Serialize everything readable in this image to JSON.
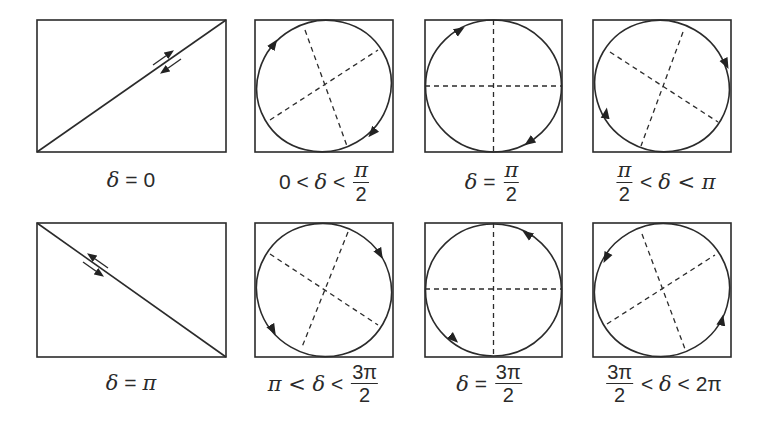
{
  "figure": {
    "stroke_color": "#2b2b2b",
    "panels": [
      {
        "id": "d0",
        "row": 0,
        "col": 0,
        "shape": "line",
        "orientation": "ascending",
        "label": {
          "parts": [
            "δ",
            " = ",
            "0"
          ],
          "text": "δ = 0"
        }
      },
      {
        "id": "d0-pi2",
        "row": 0,
        "col": 1,
        "shape": "ellipse",
        "axis_tilt": "major axis +45°",
        "rotation": "clockwise",
        "label": {
          "text": "0 < δ < π/2",
          "left": "0 < ",
          "delta": "δ",
          "rel": " < ",
          "num": "π",
          "den": "2"
        }
      },
      {
        "id": "dpi2",
        "row": 0,
        "col": 2,
        "shape": "circle",
        "rotation": "clockwise",
        "label": {
          "text": "δ = π/2",
          "delta": "δ",
          "rel": " = ",
          "num": "π",
          "den": "2"
        }
      },
      {
        "id": "dpi2-pi",
        "row": 0,
        "col": 3,
        "shape": "ellipse",
        "axis_tilt": "major axis -45°",
        "rotation": "clockwise",
        "label": {
          "text": "π/2 < δ < π",
          "num": "π",
          "den": "2",
          "rel": " < ",
          "delta": "δ",
          "right": " < π"
        }
      },
      {
        "id": "dpi",
        "row": 1,
        "col": 0,
        "shape": "line",
        "orientation": "descending",
        "label": {
          "parts": [
            "δ",
            " = ",
            "π"
          ],
          "text": "δ = π"
        }
      },
      {
        "id": "dpi-3pi2",
        "row": 1,
        "col": 1,
        "shape": "ellipse",
        "axis_tilt": "major axis -45°",
        "rotation": "counterclockwise",
        "label": {
          "text": "π < δ < 3π/2",
          "left": "π < ",
          "delta": "δ",
          "rel": " < ",
          "num": "3π",
          "den": "2"
        }
      },
      {
        "id": "d3pi2",
        "row": 1,
        "col": 2,
        "shape": "circle",
        "rotation": "counterclockwise",
        "label": {
          "text": "δ = 3π/2",
          "delta": "δ",
          "rel": " = ",
          "num": "3π",
          "den": "2"
        }
      },
      {
        "id": "d3pi2-2pi",
        "row": 1,
        "col": 3,
        "shape": "ellipse",
        "axis_tilt": "major axis +45°",
        "rotation": "counterclockwise",
        "label": {
          "text": "3π/2 < δ < 2π",
          "num": "3π",
          "den": "2",
          "rel": " < ",
          "delta": "δ",
          "right": " < 2π"
        }
      }
    ]
  }
}
